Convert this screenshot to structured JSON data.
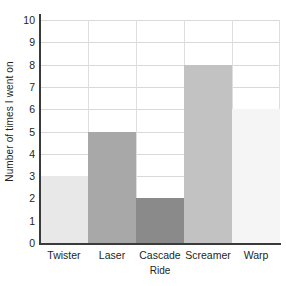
{
  "chart_data": {
    "type": "bar",
    "title": "",
    "xlabel": "Ride",
    "ylabel": "Number of times I went on",
    "categories": [
      "Twister",
      "Laser",
      "Cascade",
      "Screamer",
      "Warp"
    ],
    "values": [
      3,
      5,
      2,
      8,
      6
    ],
    "bar_colors": [
      "#e8e8e8",
      "#a8a8a8",
      "#8a8a8a",
      "#c2c2c2",
      "#f5f5f5"
    ],
    "ylim": [
      0,
      10
    ],
    "yticks": [
      0,
      1,
      2,
      3,
      4,
      5,
      6,
      7,
      8,
      9,
      10
    ],
    "ytick_labels": [
      "0",
      "1",
      "2",
      "3",
      "4",
      "5",
      "6",
      "7",
      "8",
      "9",
      "10"
    ],
    "grid": true,
    "grid_axis": "y",
    "legend": "none",
    "bar_gap": 0,
    "axis_color": "#3a3a3a",
    "grid_color": "#d9d9d9",
    "background": "#ffffff"
  }
}
